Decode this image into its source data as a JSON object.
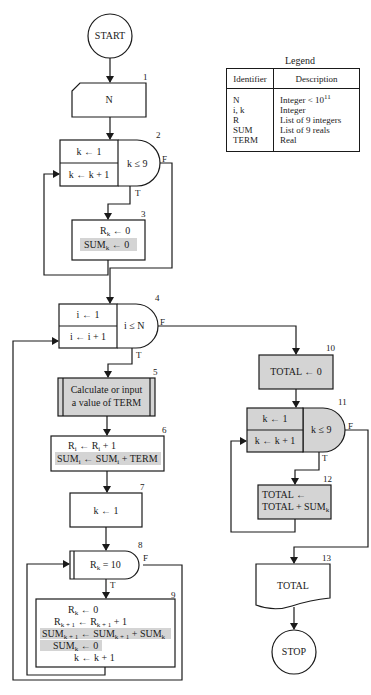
{
  "legend": {
    "title": "Legend",
    "headers": [
      "Identifier",
      "Description"
    ],
    "rows": [
      {
        "identifier": "N",
        "description": "Integer < 10",
        "sup": "11"
      },
      {
        "identifier": "i, k",
        "description": "Integer"
      },
      {
        "identifier": "R",
        "description": "List of 9 integers"
      },
      {
        "identifier": "SUM",
        "description": "List of 9 reals"
      },
      {
        "identifier": "TERM",
        "description": "Real"
      }
    ]
  },
  "nodes": {
    "start": {
      "label": "START"
    },
    "n1": {
      "num": "1",
      "label": "N"
    },
    "n2": {
      "num": "2",
      "init": "k ← 1",
      "incr": "k ← k + 1",
      "test": "k ≤ 9",
      "false": "F",
      "true": "T"
    },
    "n3": {
      "num": "3",
      "line1": "R",
      "line1_sub": "k",
      "line1_rest": " ← 0",
      "line2": "SUM",
      "line2_sub": "k",
      "line2_rest": " ← 0"
    },
    "n4": {
      "num": "4",
      "init": "i ← 1",
      "incr": "i ← i + 1",
      "test": "i ≤ N",
      "false": "F",
      "true": "T"
    },
    "n5": {
      "num": "5",
      "line1": "Calculate or input",
      "line2": "a value of TERM"
    },
    "n6": {
      "num": "6",
      "line1": "R_i ← R_i + 1",
      "line2": "SUM_i ← SUM_i + TERM"
    },
    "n7": {
      "num": "7",
      "label": "k ← 1"
    },
    "n8": {
      "num": "8",
      "test": "R_k = 10",
      "false": "F",
      "true": "T"
    },
    "n9": {
      "num": "9",
      "lines": [
        "R_k ← 0",
        "R_k+1 ← R_k+1 + 1",
        "SUM_k+1 ← SUM_k+1 + SUM_k",
        "SUM_k ← 0",
        "k ← k + 1"
      ]
    },
    "n10": {
      "num": "10",
      "label": "TOTAL ← 0"
    },
    "n11": {
      "num": "11",
      "init": "k ← 1",
      "incr": "k ← k + 1",
      "test": "k ≤ 9",
      "false": "F",
      "true": "T"
    },
    "n12": {
      "num": "12",
      "line1": "TOTAL ←",
      "line2": "TOTAL + SUM_k"
    },
    "n13": {
      "num": "13",
      "label": "TOTAL"
    },
    "stop": {
      "label": "STOP"
    }
  },
  "colors": {
    "shade": "#d4d4d4",
    "line": "#1a1a1a"
  }
}
